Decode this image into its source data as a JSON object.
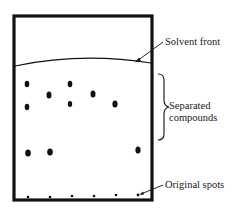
{
  "diagram": {
    "colors": {
      "ink": "#111111",
      "background": "#ffffff"
    },
    "labels": {
      "solvent_front": "Solvent front",
      "separated_line1": "Separated",
      "separated_line2": "compounds",
      "original_spots": "Original spots"
    },
    "plate": {
      "x": 14,
      "y": 16,
      "width": 138,
      "height": 184,
      "stroke_width": 3
    },
    "solvent_front_curve": {
      "start": [
        15,
        66
      ],
      "control": [
        82,
        52
      ],
      "end": [
        151,
        63
      ]
    },
    "separated_spots": [
      {
        "cx": 27,
        "cy": 84,
        "rx": 2.3,
        "ry": 3.2
      },
      {
        "cx": 70,
        "cy": 84,
        "rx": 2.3,
        "ry": 3.2
      },
      {
        "cx": 49,
        "cy": 95,
        "rx": 2.5,
        "ry": 3.5
      },
      {
        "cx": 93,
        "cy": 94,
        "rx": 2.5,
        "ry": 3.5
      },
      {
        "cx": 27,
        "cy": 107,
        "rx": 2.3,
        "ry": 3.2
      },
      {
        "cx": 70,
        "cy": 104,
        "rx": 2.2,
        "ry": 3.0
      },
      {
        "cx": 115,
        "cy": 104,
        "rx": 2.6,
        "ry": 3.6
      },
      {
        "cx": 28,
        "cy": 153,
        "rx": 2.8,
        "ry": 3.6
      },
      {
        "cx": 50,
        "cy": 152,
        "rx": 2.8,
        "ry": 3.6
      },
      {
        "cx": 138,
        "cy": 150,
        "rx": 2.6,
        "ry": 3.6
      }
    ],
    "original_spots": [
      {
        "cx": 28,
        "cy": 197
      },
      {
        "cx": 50,
        "cy": 197
      },
      {
        "cx": 72,
        "cy": 196
      },
      {
        "cx": 94,
        "cy": 196
      },
      {
        "cx": 116,
        "cy": 195
      },
      {
        "cx": 138,
        "cy": 195
      }
    ]
  }
}
